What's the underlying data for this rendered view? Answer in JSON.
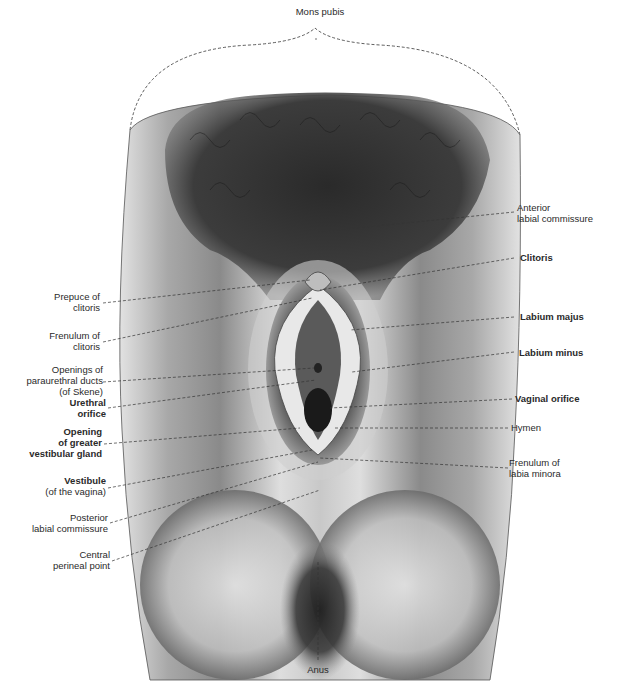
{
  "figure": {
    "type": "anatomical illustration",
    "colors": {
      "background": "#ffffff",
      "skin_light": "#d8d8d8",
      "skin_mid": "#9a9a9a",
      "shadow": "#3a3a3a",
      "hair": "#222222",
      "leader_line": "#333333"
    }
  },
  "labels": {
    "top": [
      {
        "id": "mons-pubis",
        "lines": [
          "Mons pubis"
        ],
        "bold": false
      }
    ],
    "left": [
      {
        "id": "prepuce-of-clitoris",
        "lines": [
          "Prepuce of",
          "clitoris"
        ],
        "bold": false
      },
      {
        "id": "frenulum-of-clitoris",
        "lines": [
          "Frenulum of",
          "clitoris"
        ],
        "bold": false
      },
      {
        "id": "openings-paraurethral-ducts",
        "lines": [
          "Openings of",
          "paraurethral ducts",
          "(of Skene)"
        ],
        "bold": false
      },
      {
        "id": "urethral-orifice",
        "lines": [
          "Urethral",
          "orifice"
        ],
        "bold": true
      },
      {
        "id": "opening-greater-vestibular-gland",
        "lines": [
          "Opening",
          "of greater",
          "vestibular gland"
        ],
        "bold": true
      },
      {
        "id": "vestibule",
        "lines": [
          "Vestibule",
          "(of the vagina)"
        ],
        "bold_first_line": true
      },
      {
        "id": "posterior-labial-commissure",
        "lines": [
          "Posterior",
          "labial commissure"
        ],
        "bold": false
      },
      {
        "id": "central-perineal-point",
        "lines": [
          "Central",
          "perineal point"
        ],
        "bold": false
      }
    ],
    "right": [
      {
        "id": "anterior-labial-commissure",
        "lines": [
          "Anterior",
          "labial commissure"
        ],
        "bold": false
      },
      {
        "id": "clitoris",
        "lines": [
          "Clitoris"
        ],
        "bold": true
      },
      {
        "id": "labium-majus",
        "lines": [
          "Labium majus"
        ],
        "bold": true
      },
      {
        "id": "labium-minus",
        "lines": [
          "Labium minus"
        ],
        "bold": true
      },
      {
        "id": "vaginal-orifice",
        "lines": [
          "Vaginal orifice"
        ],
        "bold": true
      },
      {
        "id": "hymen",
        "lines": [
          "Hymen"
        ],
        "bold": false
      },
      {
        "id": "frenulum-of-labia-minora",
        "lines": [
          "Frenulum of",
          "labia minora"
        ],
        "bold": false
      }
    ],
    "bottom": [
      {
        "id": "anus",
        "lines": [
          "Anus"
        ],
        "bold": false
      }
    ]
  }
}
